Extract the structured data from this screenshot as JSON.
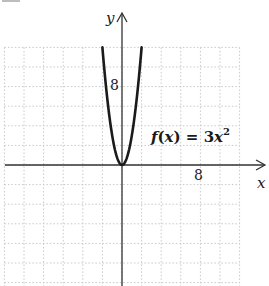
{
  "chart_data": {
    "type": "line",
    "title": "",
    "xlabel": "x",
    "ylabel": "y",
    "function_label": "f(x) = 3x²",
    "function_parts": {
      "f": "f",
      "open": "(",
      "var": "x",
      "close": ")",
      "eq": " = 3",
      "var2": "x",
      "exp": "2"
    },
    "series": [
      {
        "name": "f(x) = 3x^2",
        "x": [
          -2,
          -1.5,
          -1,
          -0.5,
          0,
          0.5,
          1,
          1.5,
          2
        ],
        "y": [
          12,
          6.75,
          3,
          0.75,
          0,
          0.75,
          3,
          6.75,
          12
        ]
      }
    ],
    "x_tick_labels": [
      {
        "value": 8,
        "label": "8"
      }
    ],
    "y_tick_labels": [
      {
        "value": 8,
        "label": "8"
      }
    ],
    "xlim": [
      -12,
      14
    ],
    "ylim": [
      -12,
      12
    ],
    "grid": true,
    "grid_step": 2,
    "grid_style": "dotted",
    "legend": "none",
    "colors": {
      "curve": "#1a1a1a",
      "axis": "#333333",
      "grid": "#c8c8c8"
    }
  }
}
